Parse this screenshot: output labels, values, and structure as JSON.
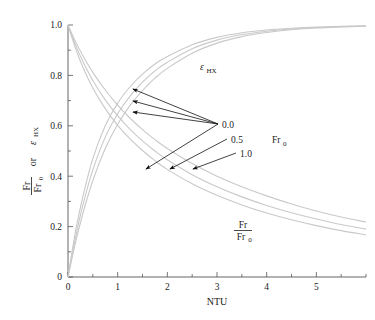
{
  "chart_data": {
    "type": "line",
    "title": "",
    "xlabel": "NTU",
    "ylabel": "Fr/Fr0 or εHX",
    "ylabel_parts": {
      "num": "Fr",
      "den": "Fr",
      "den_sub": "0",
      "conj": "or",
      "eps": "ε",
      "eps_sub": "HX"
    },
    "xlim": [
      0,
      6
    ],
    "ylim": [
      0,
      1
    ],
    "grid": false,
    "legend": "inline-annotations",
    "xticks": [
      0,
      1,
      2,
      3,
      4,
      5
    ],
    "xtick_labels": [
      "0",
      "1",
      "2",
      "3",
      "4",
      "5"
    ],
    "xminor_step": 0.5,
    "yticks": [
      0,
      0.2,
      0.4,
      0.6,
      0.8,
      1.0
    ],
    "ytick_labels": [
      "0",
      "0.2",
      "0.4",
      "0.6",
      "0.8",
      "1.0"
    ],
    "yminor_step": 0.1,
    "curve_color": "#c9c9c9",
    "parameter_name": "Fr0",
    "parameter_values": [
      "0.0",
      "0.5",
      "1.0"
    ],
    "series": [
      {
        "name": "εHX, Fr0 = 0.0",
        "family": "eps_hx",
        "param": "0.0",
        "x": [
          0,
          0.15,
          0.3,
          0.5,
          0.75,
          1.0,
          1.25,
          1.5,
          1.75,
          2.0,
          2.5,
          3.0,
          3.5,
          4.0,
          4.5,
          5.0,
          5.5,
          6.0
        ],
        "y": [
          0.0,
          0.18,
          0.32,
          0.47,
          0.6,
          0.69,
          0.755,
          0.805,
          0.845,
          0.875,
          0.922,
          0.951,
          0.969,
          0.98,
          0.987,
          0.992,
          0.995,
          0.997
        ]
      },
      {
        "name": "εHX, Fr0 = 0.5",
        "family": "eps_hx",
        "param": "0.5",
        "x": [
          0,
          0.15,
          0.3,
          0.5,
          0.75,
          1.0,
          1.25,
          1.5,
          1.75,
          2.0,
          2.5,
          3.0,
          3.5,
          4.0,
          4.5,
          5.0,
          5.5,
          6.0
        ],
        "y": [
          0.0,
          0.155,
          0.285,
          0.425,
          0.555,
          0.648,
          0.718,
          0.773,
          0.818,
          0.852,
          0.906,
          0.94,
          0.962,
          0.975,
          0.984,
          0.99,
          0.993,
          0.996
        ]
      },
      {
        "name": "εHX, Fr0 = 1.0",
        "family": "eps_hx",
        "param": "1.0",
        "x": [
          0,
          0.15,
          0.3,
          0.5,
          0.75,
          1.0,
          1.25,
          1.5,
          1.75,
          2.0,
          2.5,
          3.0,
          3.5,
          4.0,
          4.5,
          5.0,
          5.5,
          6.0
        ],
        "y": [
          0.0,
          0.135,
          0.252,
          0.383,
          0.51,
          0.606,
          0.681,
          0.74,
          0.789,
          0.828,
          0.888,
          0.928,
          0.954,
          0.97,
          0.981,
          0.988,
          0.992,
          0.995
        ]
      },
      {
        "name": "Fr/Fr0, Fr0 = 0.0",
        "family": "fr_ratio",
        "param": "0.0",
        "x": [
          0,
          0.15,
          0.3,
          0.5,
          0.75,
          1.0,
          1.25,
          1.5,
          1.75,
          2.0,
          2.5,
          3.0,
          3.5,
          4.0,
          4.5,
          5.0,
          5.5,
          6.0
        ],
        "y": [
          1.0,
          0.935,
          0.878,
          0.812,
          0.742,
          0.682,
          0.63,
          0.585,
          0.545,
          0.51,
          0.45,
          0.4,
          0.358,
          0.322,
          0.29,
          0.262,
          0.238,
          0.218
        ]
      },
      {
        "name": "Fr/Fr0, Fr0 = 0.5",
        "family": "fr_ratio",
        "param": "0.5",
        "x": [
          0,
          0.15,
          0.3,
          0.5,
          0.75,
          1.0,
          1.25,
          1.5,
          1.75,
          2.0,
          2.5,
          3.0,
          3.5,
          4.0,
          4.5,
          5.0,
          5.5,
          6.0
        ],
        "y": [
          1.0,
          0.922,
          0.855,
          0.78,
          0.703,
          0.64,
          0.586,
          0.54,
          0.5,
          0.465,
          0.406,
          0.358,
          0.318,
          0.284,
          0.255,
          0.23,
          0.208,
          0.19
        ]
      },
      {
        "name": "Fr/Fr0, Fr0 = 1.0",
        "family": "fr_ratio",
        "param": "1.0",
        "x": [
          0,
          0.15,
          0.3,
          0.5,
          0.75,
          1.0,
          1.25,
          1.5,
          1.75,
          2.0,
          2.5,
          3.0,
          3.5,
          4.0,
          4.5,
          5.0,
          5.5,
          6.0
        ],
        "y": [
          1.0,
          0.908,
          0.832,
          0.75,
          0.668,
          0.602,
          0.548,
          0.502,
          0.462,
          0.427,
          0.37,
          0.324,
          0.286,
          0.254,
          0.227,
          0.204,
          0.184,
          0.167
        ]
      }
    ],
    "annotations": [
      {
        "name": "eps-hx-label",
        "text": "εHX",
        "x": 2.8,
        "y": 0.79
      },
      {
        "name": "fr-ratio-label",
        "text": "Fr/Fr0",
        "x": 4.4,
        "y": 0.235
      },
      {
        "name": "fr0-param-label",
        "text": "Fr0",
        "x": 5.35,
        "y": 0.565
      }
    ]
  },
  "value_labels": {
    "v0": "0.0",
    "v1": "0.5",
    "v2": "1.0"
  },
  "axis": {
    "x_title": "NTU",
    "y_num": "Fr",
    "y_den": "Fr",
    "y_den_sub": "0",
    "y_conj": "or",
    "y_eps": "ε",
    "y_eps_sub": "HX"
  },
  "labels": {
    "eps_main": "ε",
    "eps_sub": "HX",
    "fr_num": "Fr",
    "fr_den": "Fr",
    "fr_den_sub": "0",
    "param_main": "Fr",
    "param_sub": "0"
  },
  "ticks": {
    "x": [
      "0",
      "1",
      "2",
      "3",
      "4",
      "5"
    ],
    "y": [
      "0",
      "0.2",
      "0.4",
      "0.6",
      "0.8",
      "1.0"
    ]
  }
}
